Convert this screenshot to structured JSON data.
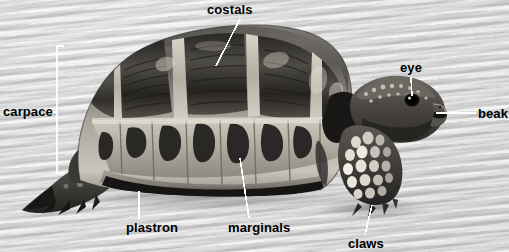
{
  "figure": {
    "view": "side view",
    "background_color": "#d4d4d4",
    "label_color": "#000000",
    "leader_color": "#ffffff"
  },
  "labels": [
    {
      "id": "costals",
      "text": "costals",
      "x": 207,
      "y": 3,
      "anchor": "left"
    },
    {
      "id": "carpace",
      "text": "carpace",
      "x": 3,
      "y": 105,
      "anchor": "left"
    },
    {
      "id": "eye",
      "text": "eye",
      "x": 400,
      "y": 61,
      "anchor": "left"
    },
    {
      "id": "beak",
      "text": "beak",
      "x": 478,
      "y": 107,
      "anchor": "left"
    },
    {
      "id": "plastron",
      "text": "plastron",
      "x": 126,
      "y": 221,
      "anchor": "left"
    },
    {
      "id": "marginals",
      "text": "marginals",
      "x": 228,
      "y": 221,
      "anchor": "left"
    },
    {
      "id": "claws",
      "text": "claws",
      "x": 348,
      "y": 237,
      "anchor": "left"
    }
  ],
  "leaders": [
    {
      "id": "costals-leader",
      "points": "240,19 216,66"
    },
    {
      "id": "eye-leader",
      "points": "411,77 412,97"
    },
    {
      "id": "beak-leader",
      "points": "476,113 436,113"
    },
    {
      "id": "plastron-leader",
      "points": "139,218 139,192"
    },
    {
      "id": "marginals-leader",
      "points": "249,218 240,158"
    },
    {
      "id": "claws-leader",
      "points": "365,234 372,205"
    }
  ],
  "bracket": {
    "id": "carpace-bracket",
    "x": 57,
    "top": 46,
    "bottom": 173,
    "tick_length": 7,
    "connector_y": 112,
    "connector_x_end": 50
  }
}
